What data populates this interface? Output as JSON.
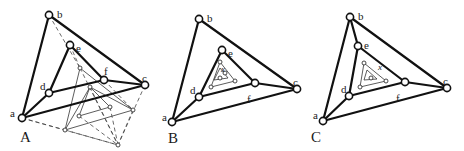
{
  "figure": {
    "panels": [
      {
        "id": "A",
        "label": "A",
        "label_pos": [
          20,
          142
        ],
        "nodes": {
          "a": {
            "label": "a",
            "pos": [
              22,
              118
            ],
            "label_pos": [
              10,
              113
            ]
          },
          "b": {
            "label": "b",
            "pos": [
              49,
              15
            ],
            "label_pos": [
              57,
              14
            ]
          },
          "c": {
            "label": "c",
            "pos": [
              145,
              85
            ],
            "label_pos": [
              142,
              78
            ]
          },
          "d": {
            "label": "d",
            "pos": [
              49,
              93
            ],
            "label_pos": [
              40,
              86
            ]
          },
          "e": {
            "label": "e",
            "pos": [
              70,
              45
            ],
            "label_pos": [
              76,
              48
            ]
          },
          "f": {
            "label": "f",
            "pos": [
              104,
              80
            ],
            "label_pos": [
              104,
              71
            ]
          }
        },
        "thick_edges": [
          [
            "a",
            "b"
          ],
          [
            "b",
            "c"
          ],
          [
            "a",
            "c"
          ],
          [
            "a",
            "d"
          ],
          [
            "d",
            "e"
          ],
          [
            "e",
            "f"
          ],
          [
            "d",
            "f"
          ],
          [
            "f",
            "c"
          ]
        ],
        "inner_points": [
          [
            80,
            68
          ],
          [
            65,
            130
          ],
          [
            133,
            110
          ],
          [
            90,
            87
          ],
          [
            79,
            116
          ],
          [
            110,
            107
          ],
          [
            118,
            145
          ]
        ],
        "thin_edges": [
          [
            [
              80,
              68
            ],
            [
              65,
              130
            ]
          ],
          [
            [
              80,
              68
            ],
            [
              133,
              110
            ]
          ],
          [
            [
              65,
              130
            ],
            [
              133,
              110
            ]
          ],
          [
            [
              90,
              87
            ],
            [
              79,
              116
            ]
          ],
          [
            [
              90,
              87
            ],
            [
              110,
              107
            ]
          ],
          [
            [
              79,
              116
            ],
            [
              110,
              107
            ]
          ],
          [
            [
              90,
              87
            ],
            [
              65,
              130
            ]
          ],
          [
            [
              90,
              87
            ],
            [
              133,
              110
            ]
          ]
        ],
        "dashed_edges": [
          [
            [
              22,
              118
            ],
            [
              65,
              130
            ]
          ],
          [
            [
              22,
              118
            ],
            [
              118,
              145
            ]
          ],
          [
            [
              65,
              130
            ],
            [
              118,
              145
            ]
          ],
          [
            [
              133,
              110
            ],
            [
              118,
              145
            ]
          ],
          [
            [
              145,
              85
            ],
            [
              118,
              145
            ]
          ],
          [
            [
              49,
              15
            ],
            [
              80,
              68
            ]
          ],
          [
            [
              70,
              45
            ],
            [
              80,
              68
            ]
          ],
          [
            [
              104,
              80
            ],
            [
              133,
              110
            ]
          ],
          [
            [
              80,
              68
            ],
            [
              118,
              145
            ]
          ],
          [
            [
              90,
              87
            ],
            [
              118,
              145
            ]
          ],
          [
            [
              110,
              107
            ],
            [
              118,
              145
            ]
          ],
          [
            [
              79,
              116
            ],
            [
              118,
              145
            ]
          ]
        ]
      },
      {
        "id": "B",
        "label": "B",
        "label_pos": [
          168,
          143
        ],
        "nodes": {
          "a": {
            "label": "a",
            "pos": [
              172,
              122
            ],
            "label_pos": [
              162,
              117
            ]
          },
          "b": {
            "label": "b",
            "pos": [
              199,
              19
            ],
            "label_pos": [
              207,
              18
            ]
          },
          "c": {
            "label": "c",
            "pos": [
              297,
              89
            ],
            "label_pos": [
              293,
              82
            ]
          },
          "d": {
            "label": "d",
            "pos": [
              199,
              97
            ],
            "label_pos": [
              190,
              90
            ]
          },
          "e": {
            "label": "e",
            "pos": [
              222,
              50
            ],
            "label_pos": [
              228,
              53
            ]
          },
          "f": {
            "label": "f",
            "pos": [
              255,
              83
            ],
            "label_pos": [
              247,
              99
            ]
          }
        },
        "thick_edges": [
          [
            "a",
            "b"
          ],
          [
            "b",
            "c"
          ],
          [
            "a",
            "c"
          ],
          [
            "a",
            "d"
          ],
          [
            "d",
            "e"
          ],
          [
            "e",
            "f"
          ],
          [
            "d",
            "f"
          ],
          [
            "f",
            "c"
          ]
        ],
        "inner_points": [
          [
            220,
            62
          ],
          [
            211,
            87
          ],
          [
            235,
            81
          ],
          [
            220,
            78
          ],
          [
            225,
            73
          ]
        ],
        "thin_edges": [
          [
            [
              220,
              62
            ],
            [
              211,
              87
            ]
          ],
          [
            [
              220,
              62
            ],
            [
              235,
              81
            ]
          ],
          [
            [
              211,
              87
            ],
            [
              235,
              81
            ]
          ],
          [
            [
              220,
              68
            ],
            [
              214,
              80
            ]
          ],
          [
            [
              220,
              68
            ],
            [
              228,
              78
            ]
          ],
          [
            [
              214,
              80
            ],
            [
              228,
              78
            ]
          ]
        ],
        "dashed_edges": [],
        "x_label": {
          "text": "x",
          "pos": [
            221,
            72
          ]
        }
      },
      {
        "id": "C",
        "label": "C",
        "label_pos": [
          311,
          142
        ],
        "nodes": {
          "a": {
            "label": "a",
            "pos": [
              323,
              121
            ],
            "label_pos": [
              313,
              115
            ]
          },
          "b": {
            "label": "b",
            "pos": [
              350,
              17
            ],
            "label_pos": [
              358,
              16
            ]
          },
          "c": {
            "label": "c",
            "pos": [
              447,
              88
            ],
            "label_pos": [
              443,
              81
            ]
          },
          "d": {
            "label": "d",
            "pos": [
              349,
              96
            ],
            "label_pos": [
              341,
              89
            ]
          },
          "e": {
            "label": "e",
            "pos": [
              358,
              46
            ],
            "label_pos": [
              364,
              45
            ]
          },
          "f": {
            "label": "f",
            "pos": [
              405,
              82
            ],
            "label_pos": [
              396,
              98
            ]
          }
        },
        "thick_edges": [
          [
            "a",
            "b"
          ],
          [
            "b",
            "c"
          ],
          [
            "a",
            "c"
          ],
          [
            "a",
            "d"
          ],
          [
            "b",
            "e"
          ],
          [
            "d",
            "e"
          ],
          [
            "e",
            "f"
          ],
          [
            "d",
            "f"
          ],
          [
            "f",
            "c"
          ]
        ],
        "inner_points": [
          [
            364,
            63
          ],
          [
            360,
            87
          ],
          [
            386,
            81
          ],
          [
            371,
            78
          ]
        ],
        "thin_edges": [
          [
            [
              364,
              63
            ],
            [
              360,
              87
            ]
          ],
          [
            [
              364,
              63
            ],
            [
              386,
              81
            ]
          ],
          [
            [
              360,
              87
            ],
            [
              386,
              81
            ]
          ],
          [
            [
              367,
              70
            ],
            [
              364,
              80
            ]
          ],
          [
            [
              367,
              70
            ],
            [
              377,
              79
            ]
          ],
          [
            [
              364,
              80
            ],
            [
              377,
              79
            ]
          ]
        ],
        "dashed_edges": [],
        "x_label": {
          "text": "x",
          "pos": [
            378,
            70
          ]
        }
      }
    ]
  }
}
